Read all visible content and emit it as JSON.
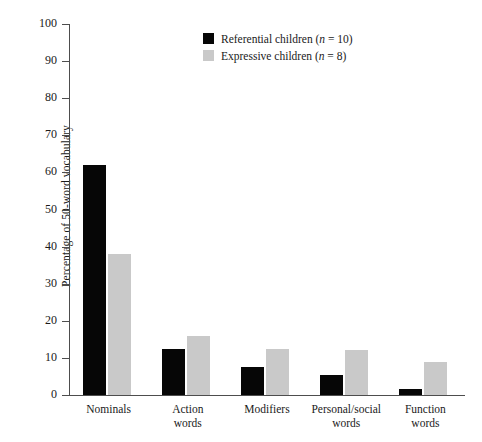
{
  "chart_data": {
    "type": "bar",
    "title": "",
    "xlabel": "",
    "ylabel": "Percentage of 50-word vocabulary",
    "ylim": [
      0,
      100
    ],
    "yticks": [
      0,
      10,
      20,
      30,
      40,
      50,
      60,
      70,
      80,
      90,
      100
    ],
    "ytick_labels": [
      "0",
      "10",
      "20",
      "30",
      "40",
      "50",
      "60",
      "70",
      "80",
      "90",
      "100"
    ],
    "grid": false,
    "legend_position": "top-center",
    "categories": [
      "Nominals",
      "Action\nwords",
      "Modifiers",
      "Personal/social\nwords",
      "Function\nwords"
    ],
    "series": [
      {
        "name": "Referential children (n = 10)",
        "label_main": "Referential children",
        "label_n": "n",
        "label_n_value": " = 10",
        "color": "#060606",
        "values": [
          62,
          12.5,
          7.5,
          5.5,
          1.5
        ]
      },
      {
        "name": "Expressive children (n = 8)",
        "label_main": "Expressive children",
        "label_n": "n",
        "label_n_value": " = 8",
        "color": "#c9c9c9",
        "values": [
          38,
          16,
          12.5,
          12,
          9
        ]
      }
    ]
  },
  "caption": {
    "text": "Figure caption partially cut off at bottom edge"
  }
}
